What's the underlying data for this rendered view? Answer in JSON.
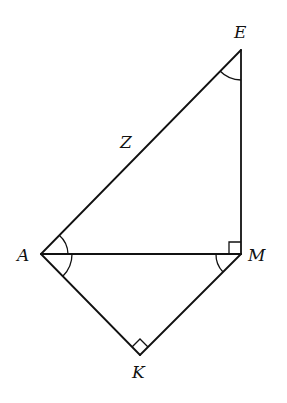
{
  "diagram": {
    "type": "geometry",
    "vertices": {
      "E": {
        "x": 241,
        "y": 50
      },
      "A": {
        "x": 41,
        "y": 254
      },
      "M": {
        "x": 241,
        "y": 254
      },
      "K": {
        "x": 140,
        "y": 355
      }
    },
    "labels": {
      "E": "E",
      "A": "A",
      "M": "M",
      "K": "K",
      "Z": "Z"
    },
    "segments": [
      "AE",
      "EM",
      "AM",
      "AK",
      "KM"
    ],
    "right_angles": [
      "AME",
      "AKM"
    ],
    "marked_angles": [
      "AEM",
      "EAM",
      "MAK",
      "AMK"
    ],
    "stroke_color": "#111111",
    "background": "#ffffff"
  }
}
